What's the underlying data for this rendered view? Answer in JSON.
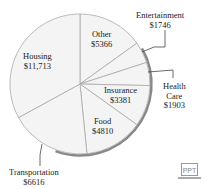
{
  "chart_data": {
    "type": "pie",
    "title": "",
    "start_angle_deg": 0,
    "direction": "clockwise",
    "slices": [
      {
        "label": "Other",
        "value": 5366,
        "display": "$5366"
      },
      {
        "label": "Entertainment",
        "value": 1746,
        "display": "$1746"
      },
      {
        "label": "Health Care",
        "value": 1903,
        "display": "$1903"
      },
      {
        "label": "Insurance",
        "value": 3381,
        "display": "$3381"
      },
      {
        "label": "Food",
        "value": 4810,
        "display": "$4810"
      },
      {
        "label": "Transportation",
        "value": 6616,
        "display": "$6616"
      },
      {
        "label": "Housing",
        "value": 11713,
        "display": "$11,713"
      }
    ],
    "colors": {
      "fill": "#f4f4f4",
      "stroke": "#aaaaaa",
      "shadow": "#888888"
    }
  },
  "labels": {
    "other": {
      "name": "Other",
      "value": "$5366"
    },
    "entertainment": {
      "name": "Entertainment",
      "value": "$1746"
    },
    "health_care": {
      "name1": "Health",
      "name2": "Care",
      "value": "$1903"
    },
    "insurance": {
      "name": "Insurance",
      "value": "$3381"
    },
    "food": {
      "name": "Food",
      "value": "$4810"
    },
    "transportation": {
      "name": "Transportation",
      "value": "$6616"
    },
    "housing": {
      "name": "Housing",
      "value": "$11,713"
    }
  },
  "badge": {
    "text": "PPT"
  }
}
